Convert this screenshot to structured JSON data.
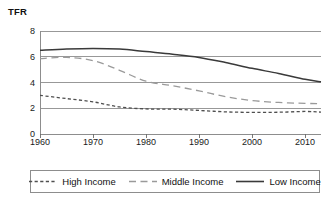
{
  "chart_data": {
    "type": "line",
    "title": "",
    "ylabel": "TFR",
    "xlabel": "",
    "xlim": [
      1960,
      2013
    ],
    "ylim": [
      0,
      8
    ],
    "grid": true,
    "legend_position": "bottom",
    "x_ticks": [
      1960,
      1970,
      1980,
      1990,
      2000,
      2010
    ],
    "x_tick_labels": [
      "1960",
      "1970",
      "1980",
      "1990",
      "2000",
      "2010"
    ],
    "y_ticks": [
      0,
      2,
      4,
      6,
      8
    ],
    "y_tick_labels": [
      "0",
      "2",
      "4",
      "6",
      "8"
    ],
    "x": [
      1960,
      1965,
      1970,
      1975,
      1980,
      1985,
      1990,
      1995,
      2000,
      2005,
      2010,
      2013
    ],
    "series": [
      {
        "name": "High Income",
        "style": "short-dash",
        "color": "#4f4f4f",
        "values": [
          3.0,
          2.75,
          2.5,
          2.1,
          1.95,
          1.93,
          1.83,
          1.72,
          1.68,
          1.69,
          1.75,
          1.7
        ]
      },
      {
        "name": "Middle Income",
        "style": "long-dash",
        "color": "#9a9a9a",
        "values": [
          5.85,
          5.95,
          5.7,
          4.95,
          4.1,
          3.75,
          3.35,
          2.9,
          2.6,
          2.45,
          2.38,
          2.35
        ]
      },
      {
        "name": "Low Income",
        "style": "solid",
        "color": "#3a3a3a",
        "values": [
          6.5,
          6.6,
          6.65,
          6.6,
          6.4,
          6.2,
          5.95,
          5.55,
          5.1,
          4.7,
          4.25,
          4.05
        ]
      }
    ]
  },
  "axis": {
    "y_title": "TFR"
  },
  "legend": {
    "entries": [
      {
        "label": "High Income"
      },
      {
        "label": "Middle Income"
      },
      {
        "label": "Low Income"
      }
    ]
  },
  "colors": {
    "grid": "#8d8d8d",
    "axis": "#6a6a6a",
    "high_income": "#4f4f4f",
    "middle_income": "#9a9a9a",
    "low_income": "#3a3a3a",
    "text": "#111111",
    "background": "#ffffff"
  }
}
